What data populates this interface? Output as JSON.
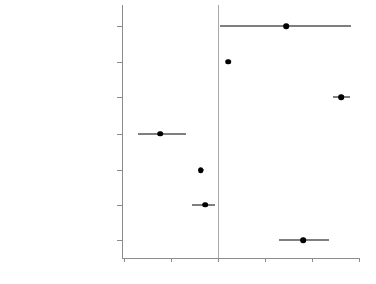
{
  "chart_data": {
    "type": "scatter",
    "subtype": "coefficient-plot-with-confidence-intervals",
    "title": "",
    "xlabel": "",
    "ylabel": "",
    "xlim": [
      -1.15,
      1.58
    ],
    "xticks": [
      -1,
      -0.5,
      0,
      0.5,
      1,
      1.5
    ],
    "xtick_labels": [
      "-1",
      "-.5",
      "0",
      ".5",
      "1",
      "1.5"
    ],
    "grid": false,
    "legend": false,
    "reference_line": 0,
    "marker_color": "#000000",
    "line_color": "#000000",
    "axis_color": "#8c8c8c",
    "categories": [
      "Sex (Woman)",
      "Age",
      "Years of Schooling",
      "Skin Color (Darker Skin)",
      "Religiosity",
      "Ideology (Right)",
      "Quintile of Wealth"
    ],
    "points": [
      {
        "label": "Sex (Woman)",
        "estimate": 0.73,
        "ci_low": 0.02,
        "ci_high": 1.42
      },
      {
        "label": "Age",
        "estimate": 0.11,
        "ci_low": 0.09,
        "ci_high": 0.13
      },
      {
        "label": "Years of Schooling",
        "estimate": 1.31,
        "ci_low": 1.22,
        "ci_high": 1.4
      },
      {
        "label": "Skin Color (Darker Skin)",
        "estimate": -0.61,
        "ci_low": -0.85,
        "ci_high": -0.34
      },
      {
        "label": "Religiosity",
        "estimate": -0.18,
        "ci_low": -0.21,
        "ci_high": -0.15
      },
      {
        "label": "Ideology (Right)",
        "estimate": -0.13,
        "ci_low": -0.27,
        "ci_high": -0.03
      },
      {
        "label": "Quintile of Wealth",
        "estimate": 0.91,
        "ci_low": 0.65,
        "ci_high": 1.18
      }
    ]
  }
}
